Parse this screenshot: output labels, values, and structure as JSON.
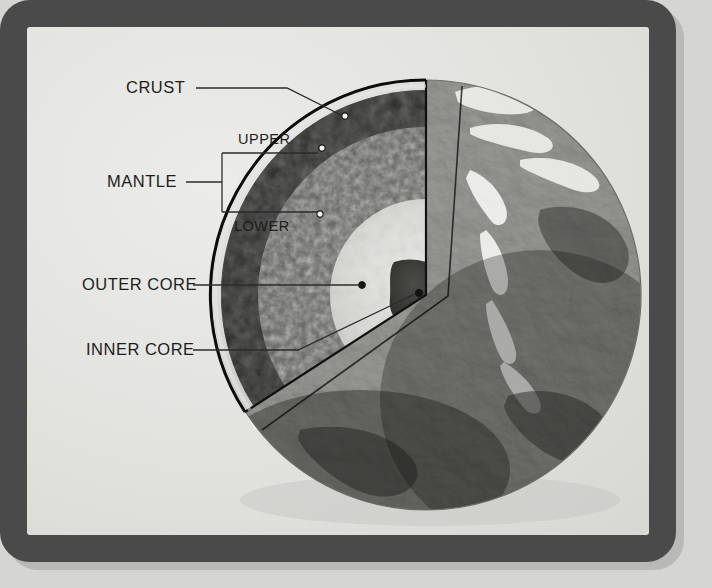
{
  "figure": {
    "frame_color": "#4a4a4a",
    "paper_color": "#e4e4e1",
    "label_color": "#1d1d1d",
    "leader_color": "#2b2b2b"
  },
  "labels": {
    "crust": "CRUST",
    "mantle": "MANTLE",
    "upper": "UPPER",
    "lower": "LOWER",
    "outer_core": "OUTER CORE",
    "inner_core": "INNER CORE"
  },
  "layers": [
    {
      "id": "crust",
      "name": "CRUST",
      "dot": [
        345,
        116
      ]
    },
    {
      "id": "upper",
      "name": "UPPER",
      "dot": [
        322,
        148
      ]
    },
    {
      "id": "lower",
      "name": "LOWER",
      "dot": [
        310,
        218
      ]
    },
    {
      "id": "outer_core",
      "name": "OUTER CORE",
      "dot": [
        362,
        285
      ]
    },
    {
      "id": "inner_core",
      "name": "INNER CORE",
      "dot": [
        419,
        294
      ]
    }
  ],
  "globe": {
    "center": [
      426,
      295
    ],
    "radius": 215,
    "cutaway": "wedge-removed-front-left",
    "visible_continents": [
      "North America",
      "South America",
      "Africa",
      "Europe",
      "Greenland"
    ]
  }
}
